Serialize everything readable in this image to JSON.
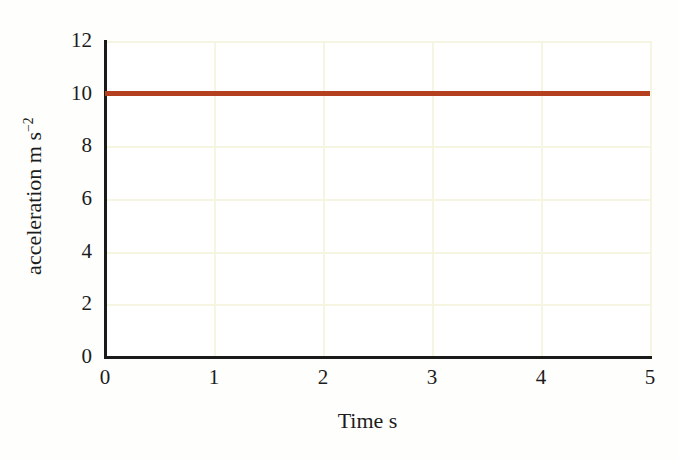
{
  "chart_data": {
    "type": "line",
    "title": "",
    "subtitle": "",
    "xlabel": "Time s",
    "ylabel_text": "acceleration m s",
    "ylabel_exponent": "−2",
    "ylabel_full": "acceleration m s⁻²",
    "xlim": [
      0,
      5
    ],
    "ylim": [
      0,
      12
    ],
    "xticks": [
      "0",
      "1",
      "2",
      "3",
      "4",
      "5"
    ],
    "yticks": [
      "0",
      "2",
      "4",
      "6",
      "8",
      "10",
      "12"
    ],
    "grid": true,
    "grid_color": "#f6f5e2",
    "axis_color": "#1a1a1a",
    "background_color": "#ffffff",
    "legend": null,
    "annotations": [],
    "series": [
      {
        "name": "acceleration",
        "color": "#b5401f",
        "linewidth": 5,
        "x": [
          0,
          1,
          2,
          3,
          4,
          5
        ],
        "values": [
          10,
          10,
          10,
          10,
          10,
          10
        ]
      }
    ]
  },
  "axes": {
    "x_title": "Time s",
    "y_title_main": "acceleration m s",
    "y_title_sup": "−2"
  },
  "ticks": {
    "x": [
      {
        "label": "0",
        "value": 0
      },
      {
        "label": "1",
        "value": 1
      },
      {
        "label": "2",
        "value": 2
      },
      {
        "label": "3",
        "value": 3
      },
      {
        "label": "4",
        "value": 4
      },
      {
        "label": "5",
        "value": 5
      }
    ],
    "y": [
      {
        "label": "0",
        "value": 0
      },
      {
        "label": "2",
        "value": 2
      },
      {
        "label": "4",
        "value": 4
      },
      {
        "label": "6",
        "value": 6
      },
      {
        "label": "8",
        "value": 8
      },
      {
        "label": "10",
        "value": 10
      },
      {
        "label": "12",
        "value": 12
      }
    ]
  }
}
